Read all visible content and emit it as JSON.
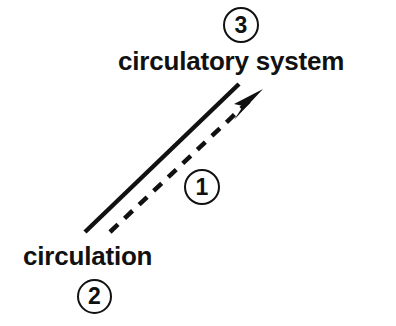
{
  "diagram": {
    "title": "",
    "background_color": "#ffffff",
    "ink_color": "#111111",
    "labels": {
      "top": "circulatory system",
      "bottom": "circulation"
    },
    "badges": {
      "one": "1",
      "two": "2",
      "three": "3"
    },
    "edges": [
      {
        "name": "solid-line",
        "style": "solid",
        "from": [
          85,
          232
        ],
        "to": [
          239,
          84
        ],
        "arrowhead": false
      },
      {
        "name": "dashed-arrow",
        "style": "dashed",
        "from": [
          110,
          232
        ],
        "to": [
          262,
          91
        ],
        "arrowhead": true
      }
    ],
    "annotations": {
      "edge_label": "1",
      "source_label": "2",
      "target_label": "3"
    }
  }
}
